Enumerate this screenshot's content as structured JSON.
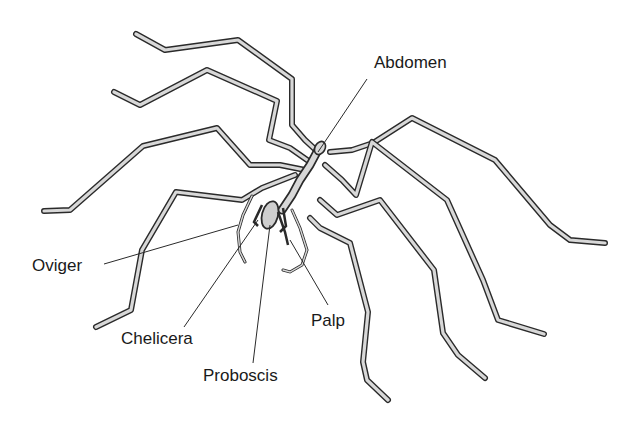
{
  "diagram": {
    "style": "monochrome pen-and-ink illustration with leader-line labels",
    "colors": {
      "background": "#ffffff",
      "ink": "#2a2a2a",
      "label_text": "#1a1a1a",
      "leg_fill": "#d8d8d8"
    },
    "labels": [
      {
        "id": "abdomen",
        "text": "Abdomen",
        "x": 374,
        "y": 54,
        "leader_from": [
          367,
          79
        ],
        "leader_to": [
          318,
          152
        ]
      },
      {
        "id": "oviger",
        "text": "Oviger",
        "x": 32,
        "y": 257,
        "leader_from": [
          104,
          264
        ],
        "leader_to": [
          238,
          225
        ]
      },
      {
        "id": "chelicera",
        "text": "Chelicera",
        "x": 121,
        "y": 330,
        "leader_from": [
          184,
          327
        ],
        "leader_to": [
          258,
          220
        ]
      },
      {
        "id": "proboscis",
        "text": "Proboscis",
        "x": 203,
        "y": 367,
        "leader_from": [
          253,
          363
        ],
        "leader_to": [
          270,
          225
        ]
      },
      {
        "id": "palp",
        "text": "Palp",
        "x": 311,
        "y": 312,
        "leader_from": [
          328,
          305
        ],
        "leader_to": [
          290,
          240
        ]
      }
    ]
  }
}
